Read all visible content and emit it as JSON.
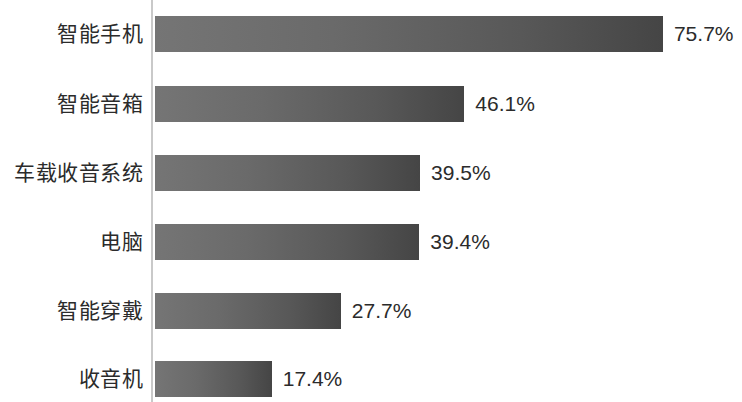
{
  "chart_data": {
    "type": "bar",
    "orientation": "horizontal",
    "title": "",
    "xlabel": "",
    "ylabel": "",
    "grid": false,
    "legend": null,
    "xlim": [
      0,
      100
    ],
    "unit": "%",
    "categories": [
      "智能手机",
      "智能音箱",
      "车载收音系统",
      "电脑",
      "智能穿戴",
      "收音机"
    ],
    "values": [
      75.7,
      46.1,
      39.5,
      39.4,
      27.7,
      17.4
    ],
    "value_labels": [
      "75.7%",
      "46.1%",
      "39.5%",
      "39.4%",
      "27.7%",
      "17.4%"
    ],
    "colors": {
      "bar_gradient_start": "#757575",
      "bar_gradient_end": "#454545",
      "axis_line": "#c9c9c9",
      "text": "#2b2b2b",
      "background": "#ffffff"
    }
  }
}
